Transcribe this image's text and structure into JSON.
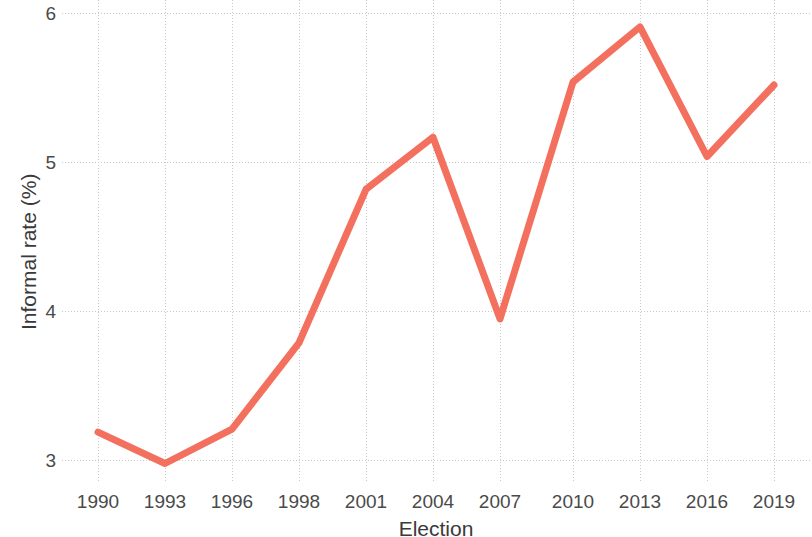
{
  "chart_data": {
    "type": "line",
    "title": "",
    "xlabel": "Election",
    "ylabel": "Informal rate (%)",
    "categories": [
      "1990",
      "1993",
      "1996",
      "1998",
      "2001",
      "2004",
      "2007",
      "2010",
      "2013",
      "2016",
      "2019"
    ],
    "values": [
      3.19,
      2.98,
      3.21,
      3.79,
      4.82,
      5.17,
      3.95,
      5.54,
      5.91,
      5.04,
      5.52
    ],
    "series": [
      {
        "name": "Informal rate",
        "values": [
          3.19,
          2.98,
          3.21,
          3.79,
          4.82,
          5.17,
          3.95,
          5.54,
          5.91,
          5.04,
          5.52
        ],
        "color": "#F4705E"
      }
    ],
    "ylim": [
      2.88,
      6.09
    ],
    "yticks": [
      3,
      4,
      5,
      6
    ],
    "ytick_labels": [
      "3",
      "4",
      "5",
      "6"
    ],
    "xtick_labels": [
      "1990",
      "1993",
      "1996",
      "1998",
      "2001",
      "2004",
      "2007",
      "2010",
      "2013",
      "2016",
      "2019"
    ],
    "grid": true,
    "grid_color": "#c8c8c8",
    "legend": false,
    "legend_position": "none",
    "line_width": 7,
    "markers": false,
    "background": "#ffffff"
  },
  "axes": {
    "y_tick_3": "3",
    "y_tick_4": "4",
    "y_tick_5": "5",
    "y_tick_6": "6",
    "x_title": "Election",
    "y_title": "Informal rate (%)"
  }
}
